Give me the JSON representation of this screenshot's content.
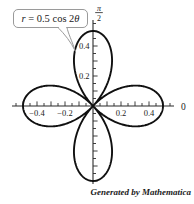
{
  "callout": {
    "equation": "r = 0.5 cos 2θ",
    "equation_parts": {
      "lhs": "r",
      "mid": " = 0.5 cos 2",
      "arg": "θ"
    }
  },
  "credit": "Generated by Mathematica",
  "colors": {
    "curve": "#101010",
    "axis": "#2b2b2b",
    "tick": "#2b2b2b",
    "label": "#222222",
    "callout_border": "#9a9a9a",
    "background": "#ffffff"
  },
  "chart_data": {
    "type": "line",
    "subtype": "polar-rose",
    "title": "r = 0.5 cos 2θ",
    "equation": {
      "r_of_theta": "0.5*cos(2*theta)",
      "amplitude": 0.5,
      "angular_frequency": 2,
      "theta_range_rad": [
        0,
        6.2832
      ]
    },
    "petals": 4,
    "max_radius": 0.5,
    "grid": false,
    "legend": false,
    "axes": {
      "x": {
        "angle_label": "0",
        "tick_label_values": [
          -0.4,
          -0.2,
          0.2,
          0.4
        ],
        "tick_labels": [
          "−0.4",
          "−0.2",
          "0.2",
          "0.4"
        ],
        "minor_tick_step": 0.05,
        "major_tick_step": 0.1,
        "range": [
          -0.55,
          0.55
        ]
      },
      "y": {
        "angle_label": "π/2",
        "angle_label_numerator": "π",
        "angle_label_denominator": "2",
        "tick_label_values": [
          0.2,
          0.4
        ],
        "tick_labels": [
          "0.2",
          "0.4"
        ],
        "minor_tick_step": 0.05,
        "major_tick_step": 0.1,
        "range": [
          -0.5,
          0.55
        ]
      }
    },
    "sample_points": [
      {
        "theta_deg": 0,
        "r": 0.5
      },
      {
        "theta_deg": 22.5,
        "r": 0.354
      },
      {
        "theta_deg": 45,
        "r": 0
      },
      {
        "theta_deg": 67.5,
        "r": -0.354
      },
      {
        "theta_deg": 90,
        "r": -0.5
      },
      {
        "theta_deg": 135,
        "r": 0
      },
      {
        "theta_deg": 180,
        "r": 0.5
      },
      {
        "theta_deg": 225,
        "r": 0
      },
      {
        "theta_deg": 270,
        "r": -0.5
      },
      {
        "theta_deg": 315,
        "r": 0
      },
      {
        "theta_deg": 360,
        "r": 0.5
      }
    ]
  }
}
